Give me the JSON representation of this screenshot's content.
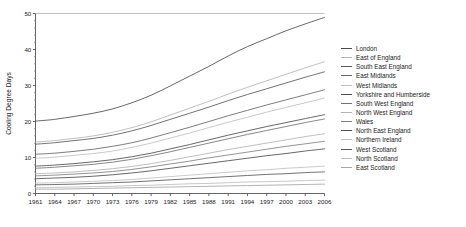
{
  "chart_data": {
    "type": "line",
    "title": "",
    "xlabel": "",
    "ylabel": "Cooling Degree Days",
    "xlim": [
      1961,
      2006
    ],
    "ylim": [
      0,
      50
    ],
    "grid": false,
    "legend_position": "right",
    "x_ticks": [
      1961,
      1964,
      1967,
      1970,
      1973,
      1976,
      1979,
      1982,
      1985,
      1988,
      1991,
      1994,
      1997,
      2000,
      2003,
      2006
    ],
    "y_ticks": [
      0,
      10,
      20,
      30,
      40,
      50
    ],
    "y_minor_ticks": [
      2,
      4,
      6,
      8,
      12,
      14,
      16,
      18,
      22,
      24,
      26,
      28,
      32,
      34,
      36,
      38,
      42,
      44,
      46,
      48
    ],
    "x": [
      1961,
      1964,
      1967,
      1970,
      1973,
      1976,
      1979,
      1982,
      1985,
      1988,
      1991,
      1994,
      1997,
      2000,
      2003,
      2006
    ],
    "series": [
      {
        "name": "London",
        "color": "#4d4d4d",
        "values": [
          20.1,
          20.6,
          21.4,
          22.3,
          23.5,
          25.2,
          27.3,
          29.9,
          32.6,
          35.3,
          38.2,
          40.8,
          43.0,
          45.2,
          47.1,
          48.9
        ]
      },
      {
        "name": "East of England",
        "color": "#b3b3b3",
        "values": [
          14.3,
          14.7,
          15.3,
          16.0,
          17.0,
          18.3,
          19.9,
          21.8,
          23.7,
          25.6,
          27.6,
          29.5,
          31.3,
          33.1,
          34.9,
          36.6
        ]
      },
      {
        "name": "South East England",
        "color": "#595959",
        "values": [
          13.7,
          14.1,
          14.7,
          15.3,
          16.2,
          17.4,
          18.9,
          20.6,
          22.3,
          24.0,
          25.8,
          27.5,
          29.1,
          30.7,
          32.3,
          33.8
        ]
      },
      {
        "name": "East Midlands",
        "color": "#666666",
        "values": [
          10.9,
          11.2,
          11.7,
          12.3,
          13.1,
          14.1,
          15.4,
          16.9,
          18.4,
          20.0,
          21.6,
          23.1,
          24.6,
          26.0,
          27.4,
          28.8
        ]
      },
      {
        "name": "West Midlands",
        "color": "#bfbfbf",
        "values": [
          9.8,
          10.1,
          10.6,
          11.1,
          11.8,
          12.8,
          14.0,
          15.4,
          16.8,
          18.3,
          19.8,
          21.2,
          22.6,
          23.9,
          25.2,
          26.5
        ]
      },
      {
        "name": "Yorkshire and Humberside",
        "color": "#4d4d4d",
        "values": [
          7.6,
          7.9,
          8.3,
          8.8,
          9.4,
          10.2,
          11.2,
          12.4,
          13.6,
          14.9,
          16.2,
          17.4,
          18.6,
          19.7,
          20.8,
          21.9
        ]
      },
      {
        "name": "South West England",
        "color": "#737373",
        "values": [
          7.0,
          7.3,
          7.7,
          8.1,
          8.7,
          9.5,
          10.5,
          11.6,
          12.8,
          14.0,
          15.2,
          16.4,
          17.5,
          18.6,
          19.7,
          20.7
        ]
      },
      {
        "name": "North West England",
        "color": "#b3b3b3",
        "values": [
          5.5,
          5.7,
          6.0,
          6.4,
          6.9,
          7.5,
          8.3,
          9.2,
          10.2,
          11.2,
          12.2,
          13.1,
          14.0,
          14.9,
          15.8,
          16.6
        ]
      },
      {
        "name": "Wales",
        "color": "#808080",
        "values": [
          4.9,
          5.1,
          5.4,
          5.7,
          6.1,
          6.7,
          7.4,
          8.2,
          9.0,
          9.9,
          10.7,
          11.5,
          12.3,
          13.1,
          13.8,
          14.5
        ]
      },
      {
        "name": "North East England",
        "color": "#4d4d4d",
        "values": [
          4.1,
          4.3,
          4.5,
          4.8,
          5.2,
          5.7,
          6.3,
          7.0,
          7.7,
          8.4,
          9.1,
          9.8,
          10.5,
          11.1,
          11.8,
          12.4
        ]
      },
      {
        "name": "Northern Ireland",
        "color": "#c0c0c0",
        "values": [
          2.9,
          3.0,
          3.2,
          3.4,
          3.6,
          3.9,
          4.3,
          4.7,
          5.1,
          5.5,
          5.9,
          6.3,
          6.6,
          7.0,
          7.3,
          7.6
        ]
      },
      {
        "name": "West Scotland",
        "color": "#595959",
        "values": [
          2.4,
          2.5,
          2.6,
          2.8,
          3.0,
          3.2,
          3.5,
          3.8,
          4.1,
          4.4,
          4.7,
          5.0,
          5.3,
          5.5,
          5.8,
          6.0
        ]
      },
      {
        "name": "North Scotland",
        "color": "#bdbdbd",
        "values": [
          1.6,
          1.7,
          1.8,
          1.9,
          2.0,
          2.2,
          2.3,
          2.5,
          2.7,
          2.8,
          3.0,
          3.2,
          3.3,
          3.4,
          3.6,
          3.7
        ]
      },
      {
        "name": "East Scotland",
        "color": "#a6a6a6",
        "values": [
          1.2,
          1.2,
          1.3,
          1.4,
          1.5,
          1.6,
          1.7,
          1.8,
          1.9,
          2.0,
          2.1,
          2.2,
          2.3,
          2.4,
          2.5,
          2.6
        ]
      }
    ]
  }
}
